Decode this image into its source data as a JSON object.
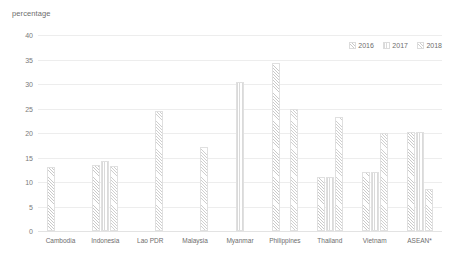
{
  "axis_title": "percentage",
  "legend": {
    "position": "top-right",
    "items": [
      {
        "label": "2016",
        "key": "2016"
      },
      {
        "label": "2017",
        "key": "2017"
      },
      {
        "label": "2018",
        "key": "2018"
      }
    ]
  },
  "yticks": [
    "40",
    "35",
    "30",
    "25",
    "20",
    "15",
    "10",
    "5",
    "0"
  ],
  "chart_data": {
    "type": "bar",
    "title": "",
    "subtitle": "",
    "xlabel": "",
    "ylabel": "percentage",
    "ylim": [
      0,
      40
    ],
    "ytick_values": [
      0,
      5,
      10,
      15,
      20,
      25,
      30,
      35,
      40
    ],
    "grid": true,
    "legend_position": "top-right",
    "categories": [
      "Cambodia",
      "Indonesia",
      "Lao PDR",
      "Malaysia",
      "Myanmar",
      "Philippines",
      "Thailand",
      "Vietnam",
      "ASEAN*"
    ],
    "series": [
      {
        "name": "2016",
        "values": [
          13.0,
          13.5,
          null,
          null,
          null,
          34.2,
          11.0,
          12.0,
          20.2
        ]
      },
      {
        "name": "2017",
        "values": [
          null,
          14.2,
          null,
          null,
          30.5,
          null,
          11.0,
          12.0,
          20.2
        ]
      },
      {
        "name": "2018",
        "values": [
          null,
          13.3,
          24.5,
          17.2,
          null,
          24.8,
          23.2,
          20.1,
          8.5
        ]
      }
    ],
    "annotations": [
      "* ASEAN aggregate"
    ]
  }
}
